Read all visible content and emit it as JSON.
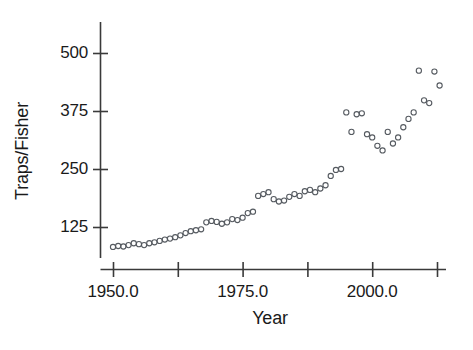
{
  "chart_data": {
    "type": "scatter",
    "title": "",
    "xlabel": "Year",
    "ylabel": "Traps/Fisher",
    "xlim": [
      1947.5,
      2014.5
    ],
    "ylim": [
      55,
      545
    ],
    "grid": false,
    "legend": null,
    "xticks": [
      1950.0,
      1962.5,
      1975.0,
      1987.5,
      2000.0,
      2012.5
    ],
    "xticklabels": [
      "1950.0",
      "",
      "1975.0",
      "",
      "2000.0",
      ""
    ],
    "yticks": [
      125,
      250,
      375,
      500
    ],
    "yticklabels": [
      "125",
      "250",
      "375",
      "500"
    ],
    "marker": "open-circle",
    "marker_color": "#555a60",
    "axis_color": "#3a3a3a",
    "series": [
      {
        "name": "Traps per Fisher",
        "x": [
          1950,
          1951,
          1952,
          1953,
          1954,
          1955,
          1956,
          1957,
          1958,
          1959,
          1960,
          1961,
          1962,
          1963,
          1964,
          1965,
          1966,
          1967,
          1968,
          1969,
          1970,
          1971,
          1972,
          1973,
          1974,
          1975,
          1976,
          1977,
          1978,
          1979,
          1980,
          1981,
          1982,
          1983,
          1984,
          1985,
          1986,
          1987,
          1988,
          1989,
          1990,
          1991,
          1992,
          1993,
          1994,
          1995,
          1996,
          1997,
          1998,
          1999,
          2000,
          2001,
          2002,
          2003,
          2004,
          2005,
          2006,
          2007,
          2008,
          2009,
          2010,
          2011,
          2012,
          2013
        ],
        "y": [
          82,
          84,
          83,
          86,
          90,
          88,
          86,
          90,
          92,
          95,
          98,
          100,
          103,
          107,
          112,
          116,
          118,
          120,
          135,
          138,
          136,
          132,
          135,
          142,
          140,
          145,
          155,
          158,
          192,
          196,
          200,
          185,
          180,
          182,
          190,
          196,
          192,
          202,
          205,
          200,
          208,
          215,
          235,
          248,
          250,
          372,
          330,
          368,
          370,
          325,
          318,
          300,
          290,
          330,
          305,
          318,
          340,
          358,
          372,
          462,
          398,
          392,
          460,
          430
        ],
        "y_extra_note": ""
      }
    ]
  },
  "axes": {
    "y_title": "Traps/Fisher",
    "x_title": "Year"
  }
}
